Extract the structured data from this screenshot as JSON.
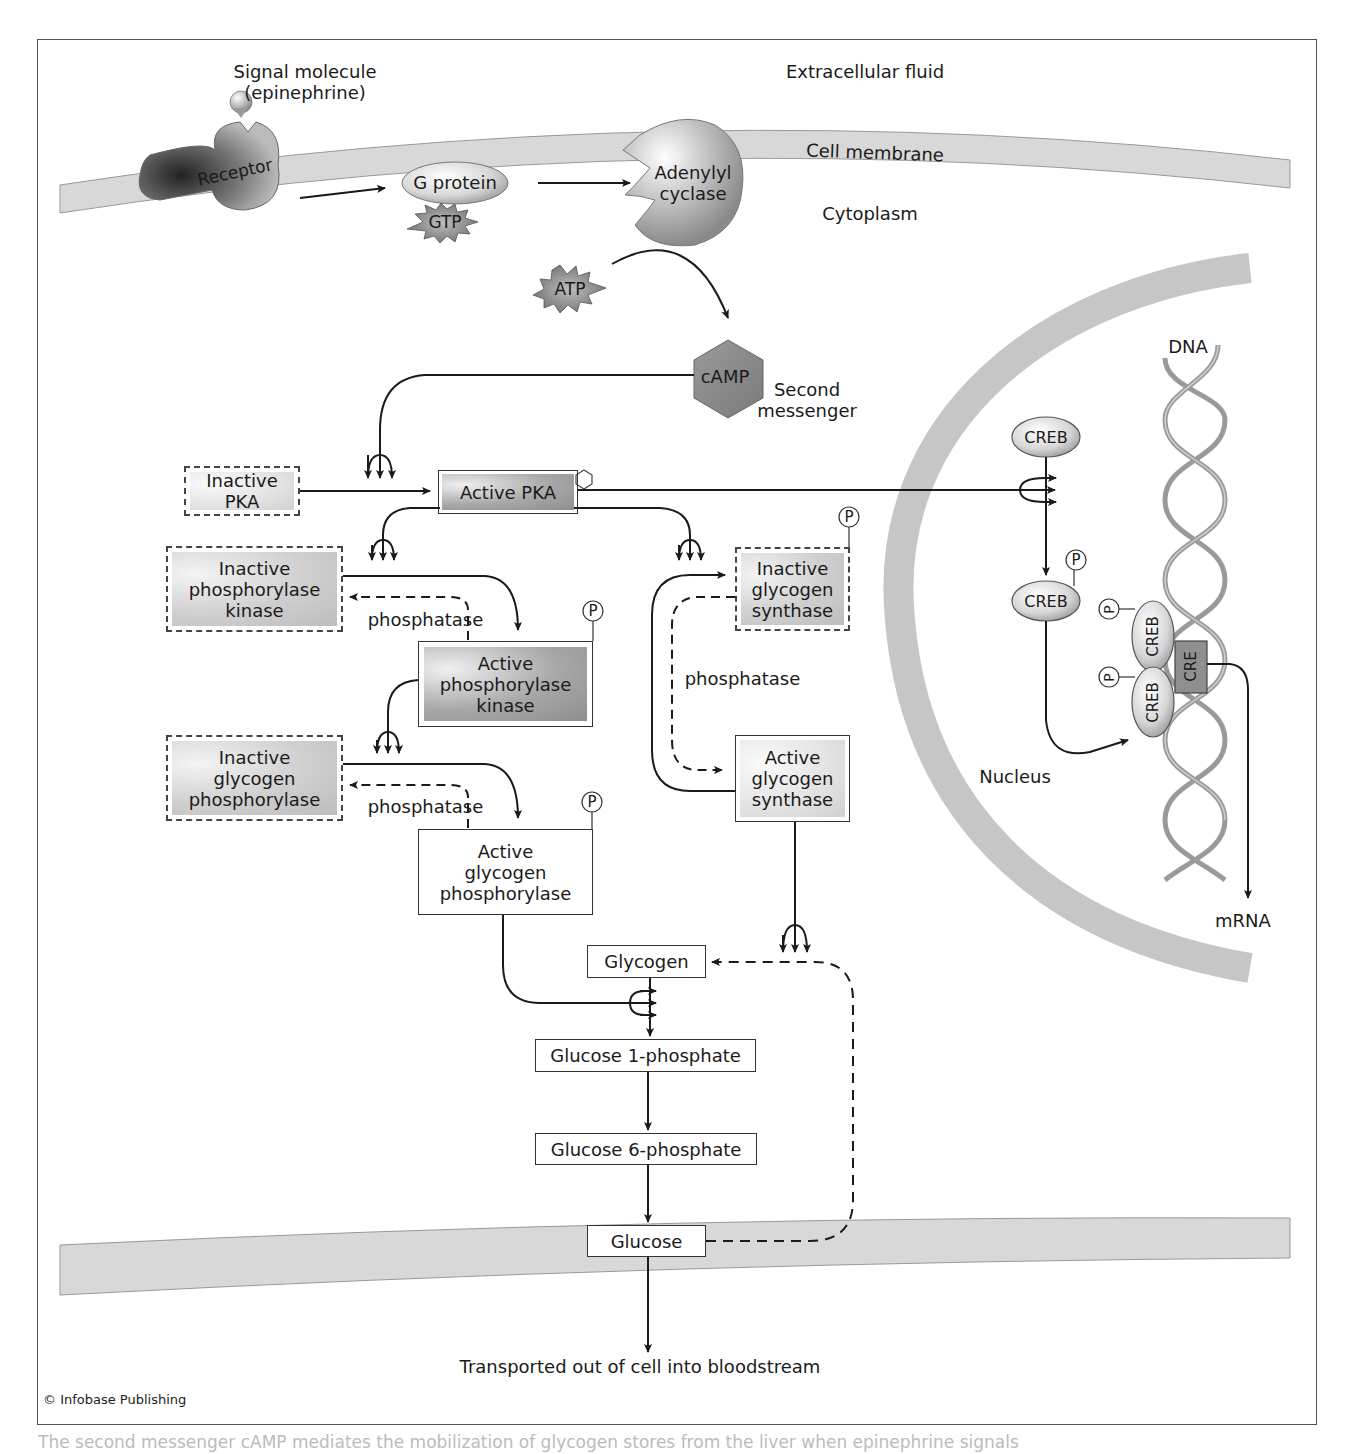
{
  "regions": {
    "extracellular": "Extracellular fluid",
    "cell_membrane": "Cell membrane",
    "cytoplasm": "Cytoplasm",
    "nucleus": "Nucleus"
  },
  "signal": {
    "line1": "Signal molecule",
    "line2": "(epinephrine)"
  },
  "membrane_proteins": {
    "receptor": "Receptor",
    "g_protein": "G protein",
    "gtp": "GTP",
    "adenylyl_line1": "Adenylyl",
    "adenylyl_line2": "cyclase",
    "atp": "ATP",
    "camp": "cAMP",
    "second_messenger_line1": "Second",
    "second_messenger_line2": "messenger"
  },
  "pka": {
    "inactive": "Inactive PKA",
    "active": "Active PKA"
  },
  "phosphorylase_kinase": {
    "inactive": [
      "Inactive",
      "phosphorylase",
      "kinase"
    ],
    "active": [
      "Active",
      "phosphorylase",
      "kinase"
    ],
    "phosphatase": "phosphatase"
  },
  "glycogen_phosphorylase": {
    "inactive": [
      "Inactive",
      "glycogen",
      "phosphorylase"
    ],
    "active": [
      "Active",
      "glycogen",
      "phosphorylase"
    ],
    "phosphatase": "phosphatase"
  },
  "glycogen_synthase": {
    "inactive": [
      "Inactive",
      "glycogen",
      "synthase"
    ],
    "active": [
      "Active",
      "glycogen",
      "synthase"
    ],
    "phosphatase": "phosphatase"
  },
  "phosphate_symbol": "P",
  "pathway": {
    "glycogen": "Glycogen",
    "g1p": "Glucose 1-phosphate",
    "g6p": "Glucose 6-phosphate",
    "glucose": "Glucose",
    "out": "Transported out of cell into bloodstream"
  },
  "nuclear": {
    "dna": "DNA",
    "creb": "CREB",
    "creb_phos": "CREB",
    "creb_dimer_top": "CREB",
    "creb_dimer_bottom": "CREB",
    "cre": "CRE",
    "mrna": "mRNA"
  },
  "footer": {
    "copyright": "© Infobase Publishing",
    "caption": "The second messenger cAMP mediates the mobilization of glycogen stores from the liver when epinephrine signals"
  },
  "colors": {
    "membrane": "#d4d4d4",
    "nuclear_envelope": "#c8c8c8",
    "line": "#1a1a1a",
    "frame": "#555555"
  }
}
